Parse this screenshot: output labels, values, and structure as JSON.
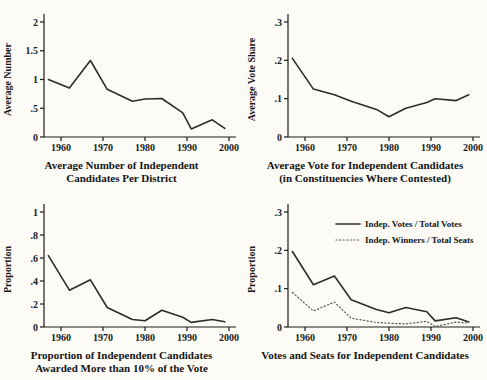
{
  "page": {
    "background": "#fcfbf6",
    "ink": "#1c1c1c",
    "solid_line_color": "#2c2c2c",
    "dotted_line_color": "#575757"
  },
  "chart_data": [
    {
      "id": "avg-number",
      "type": "line",
      "title_lines": [
        "Average Number of Independent",
        "Candidates Per District"
      ],
      "ylabel": "Average Number",
      "xlim": [
        1956,
        2001
      ],
      "ylim": [
        0,
        2
      ],
      "grid": false,
      "legend_position": "none",
      "xticks": [
        {
          "v": 1960,
          "label": "1960"
        },
        {
          "v": 1970,
          "label": "1970"
        },
        {
          "v": 1980,
          "label": "1980"
        },
        {
          "v": 1990,
          "label": "1990"
        },
        {
          "v": 2000,
          "label": "2000"
        }
      ],
      "yticks": [
        {
          "v": 0,
          "label": "0"
        },
        {
          "v": 0.5,
          "label": ".5"
        },
        {
          "v": 1,
          "label": "1"
        },
        {
          "v": 1.5,
          "label": "1.5"
        },
        {
          "v": 2,
          "label": "2"
        }
      ],
      "x": [
        1957,
        1962,
        1967,
        1971,
        1977,
        1980,
        1984,
        1989,
        1991,
        1996,
        1999
      ],
      "series": [
        {
          "name": "Average number of independent candidates per district",
          "style": "solid",
          "values": [
            1.0,
            0.85,
            1.33,
            0.83,
            0.62,
            0.66,
            0.67,
            0.42,
            0.14,
            0.3,
            0.15
          ]
        }
      ]
    },
    {
      "id": "avg-vote",
      "type": "line",
      "title_lines": [
        "Average Vote for Independent Candidates",
        "(in Constituencies Where Contested)"
      ],
      "ylabel": "Average Vote Share",
      "xlim": [
        1956,
        2001
      ],
      "ylim": [
        0,
        0.3
      ],
      "grid": false,
      "legend_position": "none",
      "xticks": [
        {
          "v": 1960,
          "label": "1960"
        },
        {
          "v": 1970,
          "label": "1970"
        },
        {
          "v": 1980,
          "label": "1980"
        },
        {
          "v": 1990,
          "label": "1990"
        },
        {
          "v": 2000,
          "label": "2000"
        }
      ],
      "yticks": [
        {
          "v": 0,
          "label": "0"
        },
        {
          "v": 0.1,
          "label": ".1"
        },
        {
          "v": 0.2,
          "label": ".2"
        },
        {
          "v": 0.3,
          "label": ".3"
        }
      ],
      "x": [
        1957,
        1962,
        1967,
        1971,
        1977,
        1980,
        1984,
        1989,
        1991,
        1996,
        1999
      ],
      "series": [
        {
          "name": "Average vote share of independent candidates",
          "style": "solid",
          "values": [
            0.205,
            0.125,
            0.11,
            0.093,
            0.072,
            0.053,
            0.075,
            0.09,
            0.1,
            0.095,
            0.11
          ]
        }
      ]
    },
    {
      "id": "prop-10pct",
      "type": "line",
      "title_lines": [
        "Proportion of Independent Candidates",
        "Awarded More than 10% of the Vote"
      ],
      "ylabel": "Proportion",
      "xlim": [
        1956,
        2001
      ],
      "ylim": [
        0,
        1
      ],
      "grid": false,
      "legend_position": "none",
      "xticks": [
        {
          "v": 1960,
          "label": "1960"
        },
        {
          "v": 1970,
          "label": "1970"
        },
        {
          "v": 1980,
          "label": "1980"
        },
        {
          "v": 1990,
          "label": "1990"
        },
        {
          "v": 2000,
          "label": "2000"
        }
      ],
      "yticks": [
        {
          "v": 0,
          "label": "0"
        },
        {
          "v": 0.2,
          "label": ".2"
        },
        {
          "v": 0.4,
          "label": ".4"
        },
        {
          "v": 0.6,
          "label": ".6"
        },
        {
          "v": 0.8,
          "label": ".8"
        },
        {
          "v": 1,
          "label": "1"
        }
      ],
      "x": [
        1957,
        1962,
        1967,
        1971,
        1977,
        1980,
        1984,
        1989,
        1991,
        1996,
        1999
      ],
      "series": [
        {
          "name": "Proportion awarded more than 10% of the vote",
          "style": "solid",
          "values": [
            0.62,
            0.32,
            0.41,
            0.17,
            0.065,
            0.055,
            0.145,
            0.085,
            0.04,
            0.065,
            0.045
          ]
        }
      ]
    },
    {
      "id": "votes-seats",
      "type": "line",
      "title_lines": [
        "Votes and Seats for Independent Candidates"
      ],
      "ylabel": "Proportion",
      "xlim": [
        1956,
        2001
      ],
      "ylim": [
        0,
        0.3
      ],
      "grid": false,
      "legend_position": "upper-right",
      "legend": {
        "x": 92,
        "y": 34,
        "row_gap": 16,
        "items": [
          {
            "label": "Indep. Votes / Total Votes",
            "style": "solid"
          },
          {
            "label": "Indep. Winners / Total Seats",
            "style": "dotted"
          }
        ]
      },
      "xticks": [
        {
          "v": 1960,
          "label": "1960"
        },
        {
          "v": 1970,
          "label": "1970"
        },
        {
          "v": 1980,
          "label": "1980"
        },
        {
          "v": 1990,
          "label": "1990"
        },
        {
          "v": 2000,
          "label": "2000"
        }
      ],
      "yticks": [
        {
          "v": 0,
          "label": "0"
        },
        {
          "v": 0.1,
          "label": ".1"
        },
        {
          "v": 0.2,
          "label": ".2"
        },
        {
          "v": 0.3,
          "label": ".3"
        }
      ],
      "x": [
        1957,
        1962,
        1967,
        1971,
        1977,
        1980,
        1984,
        1989,
        1991,
        1996,
        1999
      ],
      "series": [
        {
          "name": "Indep. Votes / Total Votes",
          "style": "solid",
          "values": [
            0.197,
            0.11,
            0.133,
            0.071,
            0.046,
            0.037,
            0.051,
            0.04,
            0.016,
            0.024,
            0.013
          ]
        },
        {
          "name": "Indep. Winners / Total Seats",
          "style": "dotted",
          "values": [
            0.09,
            0.042,
            0.065,
            0.023,
            0.012,
            0.01,
            0.008,
            0.015,
            0.001,
            0.013,
            0.01
          ]
        }
      ]
    }
  ]
}
